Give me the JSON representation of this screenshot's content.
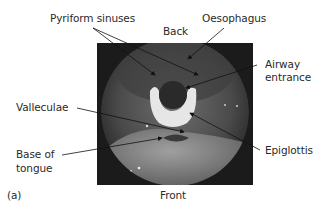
{
  "figure": {
    "panel_label": "(a)",
    "orientation": {
      "top": "Back",
      "bottom": "Front"
    },
    "labels": {
      "pyriform_sinuses": "Pyriform sinuses",
      "oesophagus": "Oesophagus",
      "airway_entrance_line1": "Airway",
      "airway_entrance_line2": "entrance",
      "valleculae": "Valleculae",
      "base_of_tongue_line1": "Base of",
      "base_of_tongue_line2": "tongue",
      "epiglottis": "Epiglottis"
    },
    "colors": {
      "text": "#2a2a2a",
      "background": "#ffffff",
      "photo_frame": "#1b1b1b"
    }
  }
}
